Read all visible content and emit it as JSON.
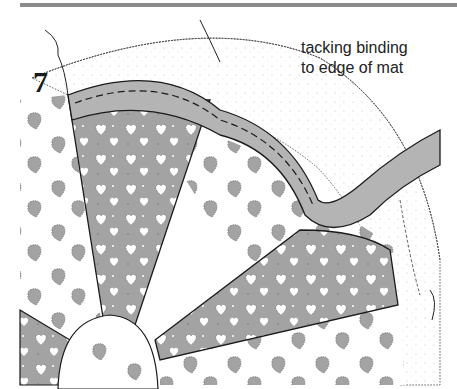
{
  "figure": {
    "step_number": "7",
    "caption_lines": [
      "tacking binding",
      "to edge of mat"
    ],
    "colors": {
      "gray_fill": "#a3a3a3",
      "binding_fill": "#b4b4b4",
      "outline": "#1a1a1a",
      "rule": "#8a8a8a",
      "background": "#ffffff"
    },
    "elements": [
      "top-rule",
      "outer-border-band",
      "binding-strip",
      "dark-wedge-panels",
      "strawberry-print-panels",
      "center-circle"
    ]
  }
}
